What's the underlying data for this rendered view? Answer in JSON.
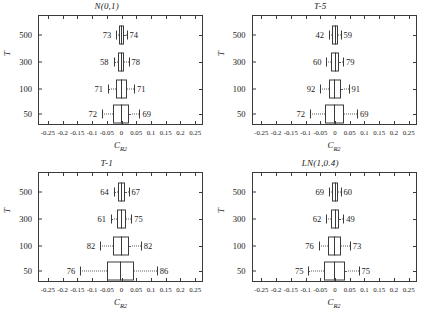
{
  "figure": {
    "xlabel_main": "C",
    "xlabel_sub": "R2",
    "ylabel": "T",
    "x_ticks": [
      "-0.25",
      "-0.2",
      "-0.15",
      "-0.1",
      "-0.05",
      "0",
      "0.05",
      "0.1",
      "0.15",
      "0.2",
      "0.25"
    ],
    "x_tick_values": [
      -0.25,
      -0.2,
      -0.15,
      -0.1,
      -0.05,
      0,
      0.05,
      0.1,
      0.15,
      0.2,
      0.25
    ],
    "y_ticks": [
      "500",
      "300",
      "100",
      "50"
    ]
  },
  "chart_data": {
    "type": "box",
    "title": "",
    "xlabel": "C_R2",
    "ylabel": "T",
    "xlim": [
      -0.28,
      0.28
    ],
    "grid": false,
    "legend": "none",
    "categories": [
      "500",
      "300",
      "100",
      "50"
    ],
    "panels": [
      {
        "title": "N(0,1)",
        "boxes": [
          {
            "category": "500",
            "whisker_low": -0.018,
            "q1": -0.009,
            "median": -0.001,
            "q3": 0.008,
            "whisker_high": 0.017,
            "left_label": "73",
            "right_label": "74"
          },
          {
            "category": "300",
            "whisker_low": -0.027,
            "q1": -0.011,
            "median": -0.001,
            "q3": 0.01,
            "whisker_high": 0.024,
            "left_label": "58",
            "right_label": "78"
          },
          {
            "category": "100",
            "whisker_low": -0.046,
            "q1": -0.02,
            "median": -0.002,
            "q3": 0.018,
            "whisker_high": 0.042,
            "left_label": "71",
            "right_label": "71"
          },
          {
            "category": "50",
            "whisker_low": -0.066,
            "q1": -0.029,
            "median": -0.003,
            "q3": 0.026,
            "whisker_high": 0.061,
            "left_label": "72",
            "right_label": "69"
          }
        ]
      },
      {
        "title": "T-5",
        "boxes": [
          {
            "category": "500",
            "whisker_low": -0.02,
            "q1": -0.01,
            "median": -0.001,
            "q3": 0.009,
            "whisker_high": 0.019,
            "left_label": "42",
            "right_label": "59"
          },
          {
            "category": "300",
            "whisker_low": -0.029,
            "q1": -0.013,
            "median": -0.001,
            "q3": 0.012,
            "whisker_high": 0.027,
            "left_label": "60",
            "right_label": "79"
          },
          {
            "category": "100",
            "whisker_low": -0.05,
            "q1": -0.022,
            "median": -0.002,
            "q3": 0.02,
            "whisker_high": 0.046,
            "left_label": "92",
            "right_label": "91"
          },
          {
            "category": "50",
            "whisker_low": -0.085,
            "q1": -0.035,
            "median": -0.003,
            "q3": 0.031,
            "whisker_high": 0.075,
            "left_label": "72",
            "right_label": "69"
          }
        ]
      },
      {
        "title": "T-1",
        "boxes": [
          {
            "category": "500",
            "whisker_low": -0.026,
            "q1": -0.012,
            "median": -0.001,
            "q3": 0.011,
            "whisker_high": 0.024,
            "left_label": "64",
            "right_label": "67"
          },
          {
            "category": "300",
            "whisker_low": -0.036,
            "q1": -0.016,
            "median": -0.001,
            "q3": 0.015,
            "whisker_high": 0.033,
            "left_label": "61",
            "right_label": "75"
          },
          {
            "category": "100",
            "whisker_low": -0.072,
            "q1": -0.029,
            "median": -0.002,
            "q3": 0.026,
            "whisker_high": 0.065,
            "left_label": "82",
            "right_label": "82"
          },
          {
            "category": "50",
            "whisker_low": -0.14,
            "q1": -0.05,
            "median": -0.004,
            "q3": 0.042,
            "whisker_high": 0.12,
            "left_label": "76",
            "right_label": "86"
          }
        ]
      },
      {
        "title": "LN(1,0.4)",
        "boxes": [
          {
            "category": "500",
            "whisker_low": -0.02,
            "q1": -0.009,
            "median": -0.001,
            "q3": 0.009,
            "whisker_high": 0.019,
            "left_label": "69",
            "right_label": "60"
          },
          {
            "category": "300",
            "whisker_low": -0.03,
            "q1": -0.013,
            "median": -0.001,
            "q3": 0.012,
            "whisker_high": 0.028,
            "left_label": "62",
            "right_label": "49"
          },
          {
            "category": "100",
            "whisker_low": -0.055,
            "q1": -0.023,
            "median": -0.002,
            "q3": 0.021,
            "whisker_high": 0.05,
            "left_label": "76",
            "right_label": "73"
          },
          {
            "category": "50",
            "whisker_low": -0.09,
            "q1": -0.037,
            "median": -0.003,
            "q3": 0.033,
            "whisker_high": 0.08,
            "left_label": "75",
            "right_label": "75"
          }
        ]
      }
    ]
  }
}
